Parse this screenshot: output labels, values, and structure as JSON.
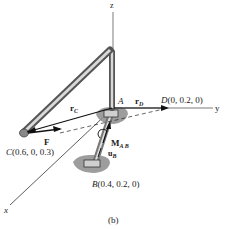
{
  "figure": {
    "caption": "(b)",
    "axes": {
      "x": "x",
      "y": "y",
      "z": "z"
    },
    "points": {
      "A": {
        "name": "A"
      },
      "B": {
        "name": "B",
        "coords": "(0.4, 0.2, 0)"
      },
      "C": {
        "name": "C",
        "coords": "(0.6, 0, 0.3)"
      },
      "D": {
        "name": "D",
        "coords": "(0, 0.2, 0)"
      }
    },
    "vectors": {
      "rC": {
        "main": "r",
        "sub": "C"
      },
      "rD": {
        "main": "r",
        "sub": "D"
      },
      "F": {
        "main": "F"
      },
      "MAB": {
        "main": "M",
        "sub": "A B"
      },
      "uB": {
        "main": "u",
        "sub": "B"
      }
    },
    "colors": {
      "pipe": "#9a9a9a",
      "pipe_highlight": "#d9d9d9",
      "support_shadow": "#8c8c8c",
      "line": "#111111"
    }
  }
}
